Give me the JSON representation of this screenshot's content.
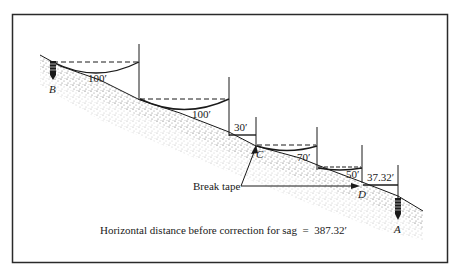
{
  "figure": {
    "frame_color": "#2a2a2a",
    "ink_color": "#1a1a1a",
    "ground_fill": "#cfcfcf"
  },
  "points": {
    "B": "B",
    "C": "C",
    "D": "D",
    "A": "A"
  },
  "segments": [
    {
      "label": "100′"
    },
    {
      "label": "100′"
    },
    {
      "label": "30′"
    },
    {
      "label": "70′"
    },
    {
      "label": "50′"
    },
    {
      "label": "37.32′"
    }
  ],
  "annotation": {
    "break_tape": "Break tape"
  },
  "caption": "Horizontal distance before correction for sag  =  387.32′"
}
